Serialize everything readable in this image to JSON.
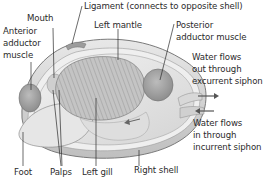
{
  "diagram": {
    "labels": {
      "ligament": "Ligament (connects to opposite shell)",
      "mouth": "Mouth",
      "anterior_adductor": [
        "Anterior",
        "adductor",
        "muscle"
      ],
      "left_mantle": "Left mantle",
      "posterior_adductor": [
        "Posterior",
        "adductor muscle"
      ],
      "excurrent": [
        "Water flows",
        "out through",
        "excurrent siphon"
      ],
      "incurrent": [
        "Water flows",
        "in through",
        "incurrent siphon"
      ],
      "foot": "Foot",
      "palps": "Palps",
      "left_gill": "Left gill",
      "right_shell": "Right shell"
    },
    "colors": {
      "text": "#2b2b2b",
      "shell": "#d9d9d9",
      "muscle": "#a8a8a8",
      "gill": "#bdbdbd",
      "arrow": "#555555"
    }
  }
}
